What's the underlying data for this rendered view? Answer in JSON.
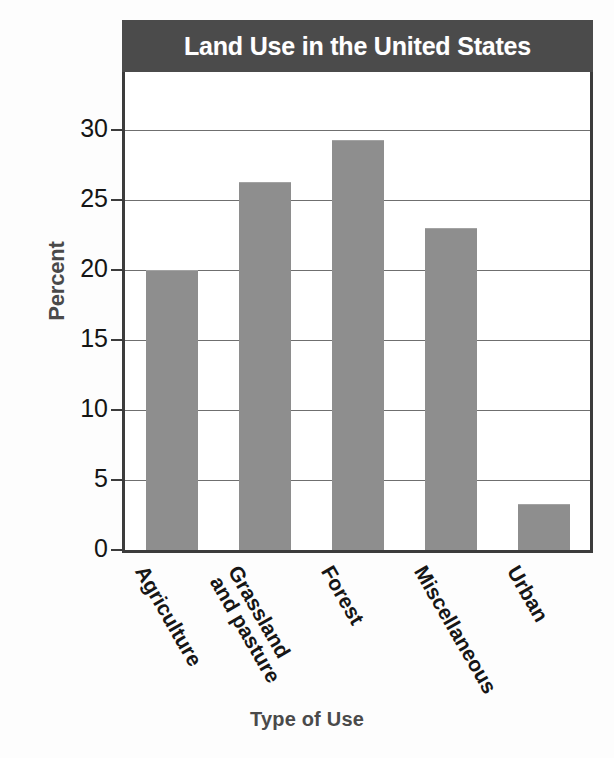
{
  "chart_data": {
    "type": "bar",
    "title": "Land Use in the United States",
    "xlabel": "Type of Use",
    "ylabel": "Percent",
    "categories": [
      "Agriculture",
      "Grassland and pasture",
      "Forest",
      "Miscellaneous",
      "Urban"
    ],
    "category_labels_display": [
      "Agriculture",
      "Grassland\nand pasture",
      "Forest",
      "Miscellaneous",
      "Urban"
    ],
    "values": [
      20,
      26.3,
      29.3,
      23,
      3.3
    ],
    "ylim": [
      0,
      32
    ],
    "yticks": [
      0,
      5,
      10,
      15,
      20,
      25,
      30
    ],
    "ytick_labels": [
      "0",
      "5",
      "10",
      "15",
      "20",
      "25",
      "30"
    ],
    "grid": true,
    "legend": false,
    "bar_color": "#8e8e8e",
    "title_band_color": "#4b4b4b",
    "title_text_color": "#ffffff",
    "axis_color": "#3c3c3c",
    "axis_title_color": "#4a4a4a"
  },
  "axis": {
    "y_title": "Percent",
    "x_title": "Type of Use"
  },
  "header": {
    "title": "Land Use in the United States"
  }
}
